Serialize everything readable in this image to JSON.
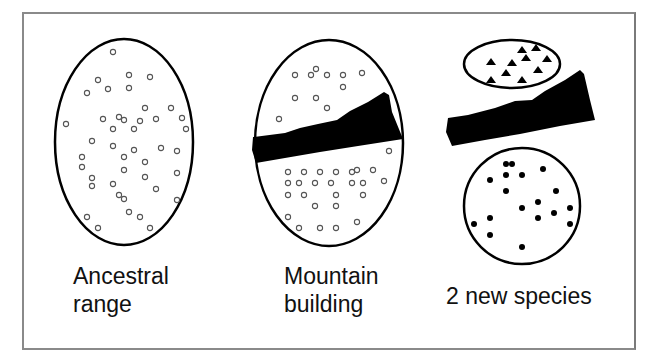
{
  "panels": [
    {
      "id": "ancestral",
      "label_lines": [
        "Ancestral",
        "range"
      ],
      "population_marker": "open-circle"
    },
    {
      "id": "mountain",
      "label_lines": [
        "Mountain",
        "building"
      ],
      "population_marker": "open-circle"
    },
    {
      "id": "new-species",
      "label_lines": [
        "2 new species"
      ],
      "population_markers": [
        "filled-triangle",
        "filled-circle"
      ]
    }
  ],
  "colors": {
    "outline": "#000000",
    "frame": "#8a8a8a",
    "marker_open": "#555555",
    "mountain": "#000000"
  }
}
